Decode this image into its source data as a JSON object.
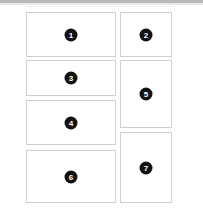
{
  "canvas": {
    "width": 203,
    "height": 217,
    "background_color": "#ffffff"
  },
  "top_bar": {
    "name": "top-divider-bar",
    "color": "#b9b9bb",
    "shade_color": "#e8e8ea",
    "hairline_color": "#ededef"
  },
  "style": {
    "panel_fill": "#ffffff",
    "panel_border_color": "#cfcfd2",
    "badge_fill": "#121212",
    "badge_text_color": "#ffffff"
  },
  "panels": [
    {
      "id": 1,
      "label": "1",
      "name": "panel-1",
      "column": "left",
      "x": 26,
      "y": 12,
      "w": 90,
      "h": 45
    },
    {
      "id": 2,
      "label": "2",
      "name": "panel-2",
      "column": "right",
      "x": 120,
      "y": 12,
      "w": 52,
      "h": 45
    },
    {
      "id": 3,
      "label": "3",
      "name": "panel-3",
      "column": "left",
      "x": 26,
      "y": 60,
      "w": 90,
      "h": 36
    },
    {
      "id": 4,
      "label": "4",
      "name": "panel-4",
      "column": "left",
      "x": 26,
      "y": 100,
      "w": 90,
      "h": 45
    },
    {
      "id": 5,
      "label": "5",
      "name": "panel-5",
      "column": "right",
      "x": 120,
      "y": 60,
      "w": 52,
      "h": 68
    },
    {
      "id": 6,
      "label": "6",
      "name": "panel-6",
      "column": "left",
      "x": 26,
      "y": 150,
      "w": 90,
      "h": 53
    },
    {
      "id": 7,
      "label": "7",
      "name": "panel-7",
      "column": "right",
      "x": 120,
      "y": 132,
      "w": 52,
      "h": 71
    }
  ]
}
